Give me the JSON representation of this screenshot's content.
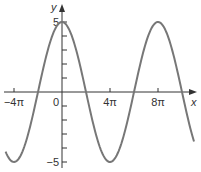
{
  "chart_data": {
    "type": "line",
    "title": "",
    "function": "y = 5cos(x/4)",
    "xlabel": "x",
    "ylabel": "y",
    "x_unit": "pi",
    "xlim_pi": [
      -4.7,
      11
    ],
    "ylim": [
      -5,
      5
    ],
    "x_ticks_pi": [
      -4,
      0,
      4,
      8
    ],
    "x_tick_labels": [
      "−4π",
      "0",
      "4π",
      "8π"
    ],
    "y_ticks": [
      -5,
      -4,
      -3,
      -2,
      -1,
      1,
      2,
      3,
      4,
      5
    ],
    "y_tick_labels": {
      "5": "5",
      "-5": "−5"
    },
    "amplitude": 5,
    "period_pi": 8,
    "series": [
      {
        "name": "curve",
        "color": "#777777"
      }
    ],
    "grid": false,
    "legend": "none"
  }
}
